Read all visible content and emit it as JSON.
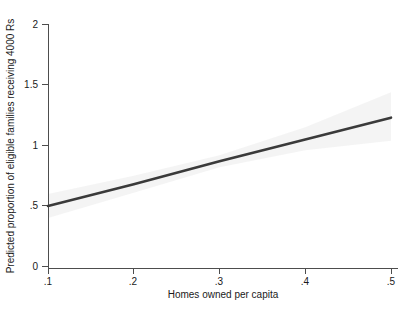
{
  "chart_data": {
    "type": "line",
    "title": "",
    "xlabel": "Homes owned per capita",
    "ylabel": "Predicted proportion of eligible families receiving 4000 Rs",
    "xlim": [
      0.1,
      0.5
    ],
    "ylim": [
      0,
      2
    ],
    "xticks": [
      0.1,
      0.2,
      0.3,
      0.4,
      0.5
    ],
    "xtick_labels": [
      ".1",
      ".2",
      ".3",
      ".4",
      ".5"
    ],
    "yticks": [
      0,
      0.5,
      1,
      1.5,
      2
    ],
    "ytick_labels": [
      "0",
      ".5",
      "1",
      "1.5",
      "2"
    ],
    "grid": false,
    "legend": "none",
    "series": [
      {
        "name": "Predicted proportion",
        "color": "#3a3a3a",
        "x": [
          0.1,
          0.2,
          0.3,
          0.4,
          0.5
        ],
        "values": [
          0.5,
          0.68,
          0.87,
          1.05,
          1.23
        ]
      }
    ],
    "confidence_band": {
      "name": "95% confidence interval",
      "color": "#f2f2f2",
      "x": [
        0.1,
        0.2,
        0.3,
        0.4,
        0.5
      ],
      "lower": [
        0.4,
        0.61,
        0.82,
        0.96,
        1.04
      ],
      "upper": [
        0.6,
        0.75,
        0.92,
        1.15,
        1.44
      ]
    },
    "spines": {
      "left": true,
      "bottom": true,
      "top": false,
      "right": false
    }
  },
  "axes": {
    "y_title": "Predicted proportion of eligible families receiving 4000 Rs",
    "x_title": "Homes owned per capita",
    "ytick_labels": [
      "2",
      "1.5",
      "1",
      ".5",
      "0"
    ],
    "xtick_labels": [
      ".1",
      ".2",
      ".3",
      ".4",
      ".5"
    ]
  }
}
